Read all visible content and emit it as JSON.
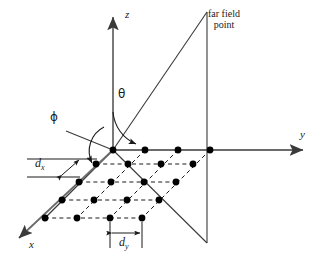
{
  "figure": {
    "type": "diagram",
    "background_color": "#ffffff",
    "line_color": "#3a3a3a",
    "dot_color": "#000000",
    "text_color": "#1a1a1a",
    "width": 323,
    "height": 263
  },
  "axes": {
    "z": {
      "label": "z",
      "origin": [
        113,
        150
      ],
      "tip": [
        113,
        14
      ],
      "direction": "up"
    },
    "y": {
      "label": "y",
      "origin": [
        113,
        150
      ],
      "tip": [
        307,
        150
      ],
      "direction": "right"
    },
    "x": {
      "label": "x",
      "origin": [
        113,
        150
      ],
      "tip": [
        14,
        243
      ],
      "direction": "down-left"
    }
  },
  "angles": {
    "theta": {
      "label": "θ",
      "label_position": [
        119,
        96
      ],
      "description": "elevation angle from z-axis to far field ray"
    },
    "phi": {
      "label": "ϕ",
      "label_position": [
        51,
        119
      ],
      "description": "azimuth angle from x-axis toward the phi reference line"
    }
  },
  "far_field": {
    "label_lines": [
      "far field",
      "point"
    ],
    "label_position": [
      213,
      14
    ],
    "point": [
      207,
      12
    ],
    "ray_from": [
      113,
      150
    ],
    "ray_to": [
      207,
      12
    ],
    "drop_line_from": [
      207,
      12
    ],
    "drop_line_to": [
      207,
      243
    ],
    "ground_line_from": [
      113,
      150
    ],
    "ground_line_to": [
      207,
      243
    ]
  },
  "spacing": {
    "dx": {
      "label": "d",
      "subscript": "x",
      "label_position": [
        37,
        163
      ],
      "description": "element spacing along x direction"
    },
    "dy": {
      "label": "d",
      "subscript": "y",
      "label_position": [
        133,
        240
      ],
      "description": "element spacing along y direction"
    }
  },
  "array": {
    "rows": 5,
    "columns": 4,
    "element_count": 20,
    "description": "planar array of isotropic elements in the x-y plane",
    "dot_radius": 3.4,
    "positions": [
      [
        [
          113,
          150
        ],
        [
          145,
          150
        ],
        [
          178,
          150
        ],
        [
          210,
          150
        ]
      ],
      [
        [
          96,
          164
        ],
        [
          128,
          164
        ],
        [
          161,
          164
        ],
        [
          193,
          164
        ]
      ],
      [
        [
          79,
          182
        ],
        [
          111,
          182
        ],
        [
          144,
          182
        ],
        [
          176,
          182
        ]
      ],
      [
        [
          62,
          200
        ],
        [
          94,
          200
        ],
        [
          127,
          200
        ],
        [
          159,
          200
        ]
      ],
      [
        [
          45,
          218
        ],
        [
          77,
          218
        ],
        [
          110,
          218
        ],
        [
          142,
          218
        ]
      ]
    ]
  }
}
